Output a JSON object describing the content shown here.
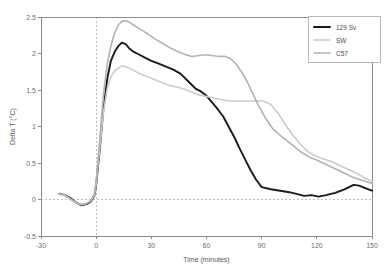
{
  "chart_data": {
    "type": "line",
    "title": "",
    "xlabel": "Time (minutes)",
    "ylabel": "Delta T (°C)",
    "xlim": [
      -30,
      150
    ],
    "ylim": [
      -0.5,
      2.5
    ],
    "xticks": [
      "-30",
      "0",
      "30",
      "60",
      "90",
      "120",
      "150"
    ],
    "xtick_values": [
      -30,
      0,
      30,
      60,
      90,
      120,
      150
    ],
    "yticks": [
      "-0.5",
      "0",
      "0.5",
      "1",
      "1.5",
      "2",
      "2.5"
    ],
    "ytick_values": [
      -0.5,
      0,
      0.5,
      1,
      1.5,
      2,
      2.5
    ],
    "grid": false,
    "reference_lines": [
      {
        "axis": "x",
        "value": 0,
        "style": "dashed"
      },
      {
        "axis": "y",
        "value": 0,
        "style": "dashed"
      }
    ],
    "legend_position": "top-right",
    "series": [
      {
        "name": "129 Sv",
        "color": "#1a1a1a",
        "width": 1.9,
        "x": [
          -20,
          -17,
          -14,
          -11,
          -8,
          -5,
          -3,
          -1,
          0,
          2,
          4,
          6,
          8,
          10,
          12,
          14,
          16,
          18,
          20,
          23,
          26,
          30,
          34,
          38,
          42,
          46,
          50,
          54,
          57,
          60,
          63,
          66,
          69,
          72,
          75,
          78,
          81,
          84,
          87,
          90,
          95,
          100,
          105,
          110,
          113,
          117,
          121,
          125,
          130,
          135,
          140,
          143,
          147,
          150
        ],
        "y": [
          0.08,
          0.06,
          0.02,
          -0.04,
          -0.08,
          -0.06,
          -0.03,
          0.05,
          0.2,
          0.7,
          1.25,
          1.65,
          1.9,
          2.02,
          2.1,
          2.15,
          2.13,
          2.07,
          2.03,
          1.99,
          1.95,
          1.9,
          1.86,
          1.82,
          1.78,
          1.72,
          1.62,
          1.52,
          1.48,
          1.42,
          1.33,
          1.24,
          1.14,
          1.0,
          0.86,
          0.7,
          0.55,
          0.4,
          0.27,
          0.17,
          0.14,
          0.12,
          0.1,
          0.07,
          0.05,
          0.06,
          0.04,
          0.06,
          0.09,
          0.14,
          0.2,
          0.19,
          0.15,
          0.12
        ]
      },
      {
        "name": "SW",
        "color": "#cccccc",
        "width": 1.6,
        "x": [
          -20,
          -17,
          -14,
          -11,
          -8,
          -5,
          -3,
          -1,
          0,
          2,
          4,
          6,
          8,
          10,
          12,
          14,
          16,
          18,
          21,
          24,
          28,
          32,
          36,
          40,
          44,
          48,
          52,
          55,
          58,
          62,
          66,
          70,
          74,
          78,
          82,
          86,
          90,
          92,
          95,
          99,
          103,
          107,
          111,
          115,
          119,
          123,
          128,
          133,
          138,
          143,
          147,
          150
        ],
        "y": [
          0.07,
          0.05,
          0.0,
          -0.05,
          -0.07,
          -0.05,
          -0.02,
          0.06,
          0.22,
          0.72,
          1.2,
          1.52,
          1.68,
          1.76,
          1.8,
          1.83,
          1.82,
          1.8,
          1.76,
          1.72,
          1.68,
          1.64,
          1.6,
          1.56,
          1.54,
          1.51,
          1.47,
          1.44,
          1.42,
          1.4,
          1.38,
          1.36,
          1.35,
          1.35,
          1.35,
          1.35,
          1.35,
          1.34,
          1.3,
          1.18,
          1.02,
          0.88,
          0.76,
          0.66,
          0.6,
          0.56,
          0.52,
          0.46,
          0.4,
          0.34,
          0.28,
          0.25
        ]
      },
      {
        "name": "C57",
        "color": "#b3b3b3",
        "width": 1.6,
        "x": [
          -20,
          -17,
          -14,
          -11,
          -8,
          -5,
          -3,
          -1,
          0,
          2,
          4,
          6,
          8,
          10,
          12,
          14,
          16,
          18,
          21,
          24,
          28,
          32,
          36,
          40,
          44,
          48,
          52,
          55,
          58,
          61,
          64,
          67,
          70,
          73,
          76,
          79,
          82,
          85,
          88,
          92,
          96,
          100,
          104,
          108,
          112,
          116,
          120,
          125,
          130,
          135,
          140,
          145,
          150
        ],
        "y": [
          0.08,
          0.06,
          0.01,
          -0.04,
          -0.07,
          -0.05,
          -0.02,
          0.07,
          0.25,
          0.85,
          1.45,
          1.85,
          2.1,
          2.28,
          2.39,
          2.44,
          2.45,
          2.43,
          2.38,
          2.33,
          2.27,
          2.2,
          2.14,
          2.08,
          2.03,
          1.99,
          1.96,
          1.97,
          1.98,
          1.98,
          1.97,
          1.96,
          1.96,
          1.93,
          1.86,
          1.75,
          1.62,
          1.46,
          1.3,
          1.12,
          0.97,
          0.88,
          0.8,
          0.72,
          0.64,
          0.58,
          0.54,
          0.48,
          0.42,
          0.36,
          0.3,
          0.26,
          0.22
        ]
      }
    ]
  }
}
